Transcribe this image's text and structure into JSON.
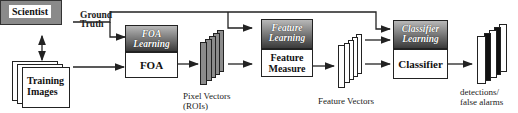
{
  "diagram": {
    "nodes": {
      "scientist": "Scientist",
      "ground_truth_line1": "Ground",
      "ground_truth_line2": "Truth",
      "training_images_line1": "Training",
      "training_images_line2": "Images",
      "foa_learning_line1": "FOA",
      "foa_learning_line2": "Learning",
      "foa": "FOA",
      "feature_learning_line1": "Feature",
      "feature_learning_line2": "Learning",
      "feature_measure_line1": "Feature",
      "feature_measure_line2": "Measure",
      "classifier_learning_line1": "Classifier",
      "classifier_learning_line2": "Learning",
      "classifier": "Classifier"
    },
    "outputs": {
      "pixel_vectors_line1": "Pixel Vectors",
      "pixel_vectors_line2": "(ROIs)",
      "feature_vectors": "Feature Vectors",
      "detections_line1": "detections/",
      "detections_line2": "false alarms"
    },
    "colors": {
      "scientist_fill": "#8a8a8a",
      "learning_gradient_top": "#b8b8b8",
      "learning_gradient_bottom": "#3a3a3a",
      "pixel_vector_fill": "#8c8c8c",
      "line": "#222222"
    }
  }
}
